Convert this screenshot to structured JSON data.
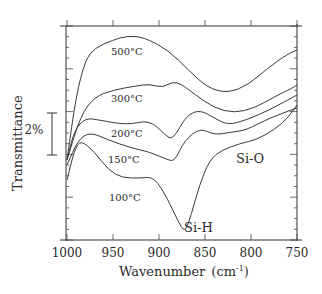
{
  "chart_data": {
    "type": "line",
    "title": "",
    "xlabel": "Wavenumber (cm-1)",
    "xlabel_main": "Wavenumber",
    "xlabel_unit_base": "(cm",
    "xlabel_unit_exp": "-1",
    "xlabel_unit_close": ")",
    "ylabel": "Transmittance",
    "xlim": [
      1000,
      750
    ],
    "x_reversed": true,
    "x_ticks": [
      "1000",
      "950",
      "900",
      "850",
      "800",
      "750"
    ],
    "scale_bar": "2%",
    "grid": false,
    "legend": "inline labels",
    "annotations": [
      "Si-H",
      "Si-O"
    ],
    "series": [
      {
        "name": "500°C",
        "x": [
          1000,
          990,
          980,
          970,
          950,
          935,
          917,
          890,
          868,
          847,
          825,
          803,
          782,
          760,
          750
        ],
        "y_px": [
          160,
          95,
          60,
          48,
          40,
          36,
          37,
          50,
          70,
          88,
          93,
          85,
          68,
          54,
          50
        ]
      },
      {
        "name": "300°C",
        "x": [
          1000,
          985,
          970,
          950,
          925,
          910,
          896,
          882,
          860,
          840,
          818,
          796,
          775,
          755,
          750
        ],
        "y_px": [
          160,
          115,
          97,
          90,
          86,
          84,
          88,
          80,
          95,
          108,
          113,
          108,
          97,
          88,
          85
        ]
      },
      {
        "name": "200°C",
        "x": [
          1000,
          992,
          980,
          965,
          935,
          910,
          893,
          885,
          870,
          855,
          840,
          825,
          805,
          780,
          750
        ],
        "y_px": [
          160,
          130,
          118,
          120,
          125,
          120,
          135,
          140,
          115,
          110,
          118,
          125,
          120,
          110,
          95
        ]
      },
      {
        "name": "150°C",
        "x": [
          1000,
          988,
          975,
          955,
          930,
          910,
          890,
          883,
          872,
          855,
          840,
          820,
          805,
          780,
          750
        ],
        "y_px": [
          165,
          140,
          132,
          140,
          148,
          152,
          160,
          161,
          140,
          128,
          135,
          132,
          130,
          118,
          108
        ]
      },
      {
        "name": "100°C",
        "x": [
          1000,
          992,
          985,
          970,
          955,
          940,
          920,
          905,
          890,
          880,
          872,
          865,
          856,
          845,
          832,
          810,
          795,
          775,
          760,
          750
        ],
        "y_px": [
          180,
          150,
          140,
          152,
          170,
          178,
          178,
          177,
          200,
          220,
          233,
          215,
          185,
          160,
          150,
          143,
          140,
          130,
          118,
          105
        ]
      }
    ]
  },
  "labels": {
    "curves": [
      "500°C",
      "300°C",
      "200°C",
      "150°C",
      "100°C"
    ],
    "si_h": "Si-H",
    "si_o": "Si-O",
    "scale": "2%"
  }
}
